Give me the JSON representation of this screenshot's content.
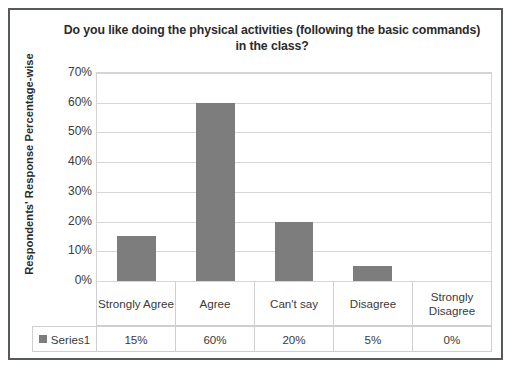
{
  "chart_data": {
    "type": "bar",
    "title": "Do you like doing the physical activities (following the basic commands) in the class?",
    "xlabel": "",
    "ylabel": "Respondents' Response Percentage-wise",
    "categories": [
      "Strongly Agree",
      "Agree",
      "Can't say",
      "Disagree",
      "Strongly Disagree"
    ],
    "series": [
      {
        "name": "Series1",
        "values": [
          15,
          60,
          20,
          5,
          0
        ],
        "value_labels": [
          "15%",
          "60%",
          "20%",
          "5%",
          "0%"
        ],
        "color": "#7d7d7d"
      }
    ],
    "ylim": [
      0,
      70
    ],
    "ytick_values": [
      0,
      10,
      20,
      30,
      40,
      50,
      60,
      70
    ],
    "ytick_labels": [
      "0%",
      "10%",
      "20%",
      "30%",
      "40%",
      "50%",
      "60%",
      "70%"
    ],
    "grid": true,
    "legend_position": "bottom-table",
    "legend_entries": [
      "Series1"
    ],
    "data_table": {
      "row_header": "Series1",
      "columns": [
        "Strongly Agree",
        "Agree",
        "Can't say",
        "Disagree",
        "Strongly Disagree"
      ],
      "values": [
        "15%",
        "60%",
        "20%",
        "5%",
        "0%"
      ]
    }
  },
  "colors": {
    "bar": "#7d7d7d",
    "gridline": "#d6d6d6",
    "border": "#555a5e",
    "table_border": "#cfcfcf",
    "text": "#2b2b2b"
  }
}
